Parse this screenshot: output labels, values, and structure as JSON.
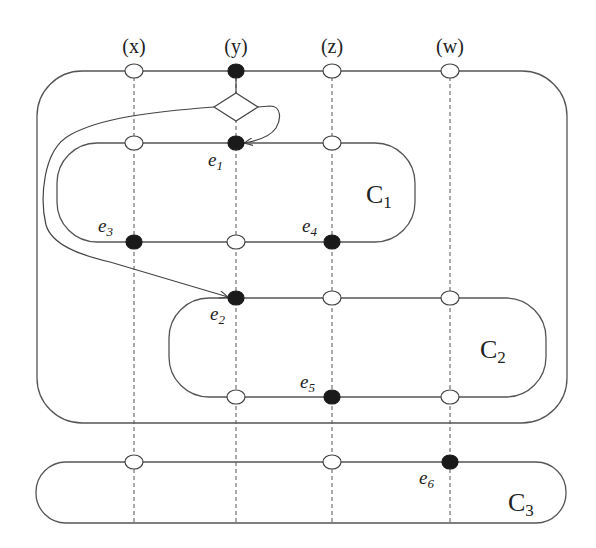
{
  "diagram": {
    "columns": [
      {
        "id": "x",
        "label": "(x)",
        "x": 134
      },
      {
        "id": "y",
        "label": "(y)",
        "x": 236
      },
      {
        "id": "z",
        "label": "(z)",
        "x": 332
      },
      {
        "id": "w",
        "label": "(w)",
        "x": 450
      }
    ],
    "components": [
      {
        "id": "outer",
        "label": "",
        "sub": ""
      },
      {
        "id": "C1",
        "label": "C",
        "sub": "1"
      },
      {
        "id": "C2",
        "label": "C",
        "sub": "2"
      },
      {
        "id": "C3",
        "label": "C",
        "sub": "3"
      }
    ],
    "events": [
      {
        "id": "e1",
        "label": "e",
        "sub": "1"
      },
      {
        "id": "e2",
        "label": "e",
        "sub": "2"
      },
      {
        "id": "e3",
        "label": "e",
        "sub": "3"
      },
      {
        "id": "e4",
        "label": "e",
        "sub": "4"
      },
      {
        "id": "e5",
        "label": "e",
        "sub": "5"
      },
      {
        "id": "e6",
        "label": "e",
        "sub": "6"
      }
    ],
    "nodes": [
      {
        "line": "outer-top",
        "column": "x",
        "filled": false
      },
      {
        "line": "outer-top",
        "column": "y",
        "filled": true
      },
      {
        "line": "outer-top",
        "column": "z",
        "filled": false
      },
      {
        "line": "outer-top",
        "column": "w",
        "filled": false
      },
      {
        "line": "C1-top",
        "column": "x",
        "filled": false
      },
      {
        "line": "C1-top",
        "column": "y",
        "filled": true,
        "event": "e1"
      },
      {
        "line": "C1-top",
        "column": "z",
        "filled": false
      },
      {
        "line": "C1-bottom",
        "column": "x",
        "filled": true,
        "event": "e3"
      },
      {
        "line": "C1-bottom",
        "column": "y",
        "filled": false
      },
      {
        "line": "C1-bottom",
        "column": "z",
        "filled": true,
        "event": "e4"
      },
      {
        "line": "C2-top",
        "column": "y",
        "filled": true,
        "event": "e2"
      },
      {
        "line": "C2-top",
        "column": "z",
        "filled": false
      },
      {
        "line": "C2-top",
        "column": "w",
        "filled": false
      },
      {
        "line": "C2-bottom",
        "column": "y",
        "filled": false
      },
      {
        "line": "C2-bottom",
        "column": "z",
        "filled": true,
        "event": "e5"
      },
      {
        "line": "C2-bottom",
        "column": "w",
        "filled": false
      },
      {
        "line": "C3-top",
        "column": "x",
        "filled": false
      },
      {
        "line": "C3-top",
        "column": "z",
        "filled": false
      },
      {
        "line": "C3-top",
        "column": "w",
        "filled": true,
        "event": "e6"
      }
    ],
    "decision": {
      "shape": "diamond",
      "branches_to": [
        "e1",
        "e2"
      ]
    }
  }
}
